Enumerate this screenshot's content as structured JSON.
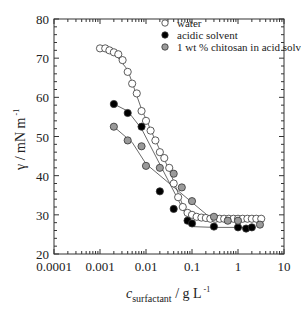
{
  "chart_data": {
    "type": "scatter",
    "title": "",
    "xlabel": "c_surfactant / g L^-1",
    "xlabel_main": "c",
    "xlabel_sub": "surfactant",
    "xlabel_unit": " / g L",
    "xlabel_sup": "-1",
    "ylabel": "γ / mN m^-1",
    "ylabel_main": "γ / mN m",
    "ylabel_sup": "-1",
    "xscale": "log",
    "xlim": [
      0.0001,
      10
    ],
    "ylim": [
      20,
      80
    ],
    "x_ticks": [
      "0.0001",
      "0.001",
      "0.01",
      "0.1",
      "1",
      "10"
    ],
    "y_ticks": [
      "20",
      "30",
      "40",
      "50",
      "60",
      "70",
      "80"
    ],
    "grid": false,
    "legend_position": "upper right",
    "series": [
      {
        "name": "water",
        "marker": "open-circle",
        "fill": "#ffffff",
        "x": [
          0.001,
          0.0013,
          0.0016,
          0.002,
          0.0025,
          0.0031,
          0.004,
          0.005,
          0.0063,
          0.008,
          0.01,
          0.0126,
          0.016,
          0.02,
          0.025,
          0.032,
          0.04,
          0.05,
          0.063,
          0.08,
          0.1,
          0.126,
          0.16,
          0.2,
          0.25,
          0.32,
          0.4,
          0.5,
          0.63,
          0.8,
          1.0,
          1.26,
          1.6,
          2.0,
          2.5,
          3.2
        ],
        "y": [
          72.5,
          72.5,
          72.0,
          71.5,
          71.0,
          69.5,
          66.5,
          63.5,
          61.0,
          56.5,
          54.0,
          51.5,
          49.0,
          46.0,
          44.5,
          42.0,
          38.0,
          34.5,
          32.0,
          30.5,
          30.0,
          29.5,
          29.3,
          29.2,
          29.0,
          29.0,
          29.0,
          29.0,
          29.0,
          29.0,
          29.0,
          29.0,
          29.0,
          29.0,
          29.0,
          29.0
        ]
      },
      {
        "name": "acidic solvent",
        "marker": "filled-circle",
        "fill": "#000000",
        "x": [
          0.002,
          0.004,
          0.008,
          0.02,
          0.04,
          0.08,
          0.1,
          0.3,
          1.0,
          1.5,
          2.0
        ],
        "y": [
          58.3,
          56.0,
          52.5,
          36.0,
          31.5,
          28.5,
          27.8,
          27.0,
          26.8,
          26.5,
          26.8
        ]
      },
      {
        "name": "1 wt % chitosan in acid solvent",
        "marker": "gray-circle",
        "fill": "#9a9a9a",
        "x": [
          0.002,
          0.004,
          0.008,
          0.01,
          0.02,
          0.04,
          0.06,
          0.1,
          0.3,
          0.6,
          1.0,
          3.0
        ],
        "y": [
          52.5,
          49.0,
          47.5,
          42.5,
          42.0,
          40.5,
          37.0,
          33.5,
          29.5,
          28.5,
          28.5,
          27.5
        ]
      }
    ],
    "fit_lines": [
      {
        "series": "water",
        "x": [
          0.001,
          0.002,
          0.004,
          0.008,
          0.016,
          0.032,
          0.07,
          0.15,
          0.4,
          3.2
        ],
        "y": [
          72.5,
          71.5,
          67.0,
          57.0,
          49.0,
          41.5,
          31.0,
          29.3,
          29.0,
          29.0
        ]
      },
      {
        "series": "acidic solvent",
        "x": [
          0.002,
          0.004,
          0.008,
          0.1,
          0.3,
          2.0
        ],
        "y": [
          58.3,
          56.5,
          52.0,
          27.0,
          26.8,
          26.8
        ]
      },
      {
        "series": "1 wt % chitosan in acid solvent",
        "x": [
          0.002,
          0.005,
          0.01,
          0.3,
          3.0
        ],
        "y": [
          52.5,
          48.5,
          43.0,
          28.5,
          28.3
        ]
      }
    ]
  }
}
